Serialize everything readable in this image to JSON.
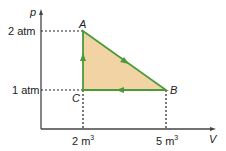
{
  "diagram": {
    "type": "pV cycle",
    "axes": {
      "y_label": "p",
      "x_label": "V"
    },
    "y_ticks": [
      "2 atm",
      "1 atm"
    ],
    "x_ticks": [
      "2 m",
      "5 m"
    ],
    "x_tick_unit_exp": "3",
    "points": {
      "A": {
        "label": "A",
        "V": 2,
        "p": 2
      },
      "B": {
        "label": "B",
        "V": 5,
        "p": 1
      },
      "C": {
        "label": "C",
        "V": 2,
        "p": 1
      }
    },
    "cycle": [
      "A",
      "B",
      "C",
      "A"
    ],
    "colors": {
      "fill": "#f2d3a4",
      "path": "#4a9a3a",
      "axis": "#444444"
    }
  }
}
